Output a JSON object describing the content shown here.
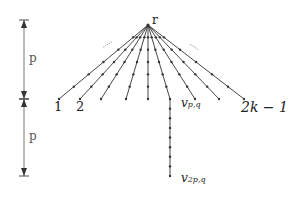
{
  "diagram": {
    "type": "tree",
    "colors": {
      "stroke": "#333333",
      "dimension": "#666666",
      "text": "#222222"
    },
    "root": {
      "label": "r",
      "x": 148,
      "y": 25
    },
    "leaves_y": 99,
    "branches": [
      {
        "x": 59,
        "label": "1"
      },
      {
        "x": 80,
        "label": "2"
      },
      {
        "x": 101,
        "label": ""
      },
      {
        "x": 126,
        "label": ""
      },
      {
        "x": 148,
        "label": ""
      },
      {
        "x": 170,
        "label": "v_{p,q}"
      },
      {
        "x": 195,
        "label": ""
      },
      {
        "x": 219,
        "label": ""
      },
      {
        "x": 244,
        "label": "2k − 1"
      }
    ],
    "extended_branch": {
      "x": 170,
      "y_start": 99,
      "y_end": 176,
      "label": "v_{2p,q}"
    },
    "ellipses": [
      {
        "side": "left",
        "text": "....."
      },
      {
        "side": "right",
        "text": "....."
      }
    ],
    "dimensions": [
      {
        "label": "p",
        "y_top": 20,
        "y_bottom": 99
      },
      {
        "label": "p",
        "y_top": 99,
        "y_bottom": 176
      }
    ]
  },
  "labels": {
    "root": "r",
    "leaf1": "1",
    "leaf2": "2",
    "leaf_last": "2k − 1",
    "vpq_main": "v",
    "vpq_sub": "p,q",
    "v2pq_main": "v",
    "v2pq_sub": "2p,q",
    "dim_top": "p",
    "dim_bottom": "p"
  }
}
